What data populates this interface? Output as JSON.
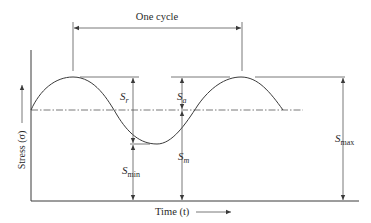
{
  "diagram": {
    "title": "One cycle",
    "axes": {
      "y_label": "Stress (σ)",
      "x_label": "Time (t)"
    },
    "labels": {
      "sr": {
        "main": "S",
        "sub": "r"
      },
      "sa": {
        "main": "S",
        "sub": "a"
      },
      "sm": {
        "main": "S",
        "sub": "m"
      },
      "smin": {
        "main": "S",
        "sub": "min"
      },
      "smax": {
        "main": "S",
        "sub": "max"
      }
    },
    "colors": {
      "stroke": "#3a3a3a",
      "text": "#2a2a2a",
      "background": "#ffffff"
    }
  }
}
